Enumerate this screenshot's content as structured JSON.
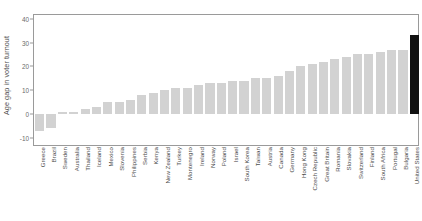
{
  "chart_data": {
    "type": "bar",
    "title": "",
    "xlabel": "",
    "ylabel": "Age gap in voter turnout",
    "ylim": [
      -13,
      42
    ],
    "yticks": [
      -10,
      0,
      10,
      20,
      30,
      40
    ],
    "ytick_labels": [
      "-10",
      "0",
      "10",
      "20",
      "30",
      "40"
    ],
    "grid": false,
    "legend": "none",
    "bar_color": "#d2d2d2",
    "highlight_color": "#111111",
    "highlight_category": "United States",
    "categories": [
      "Greece",
      "Brazil",
      "Sweden",
      "Australia",
      "Thailand",
      "Iceland",
      "Mexico",
      "Slovenia",
      "Philippines",
      "Serbia",
      "Kenya",
      "New Zealand",
      "Turkey",
      "Montenegro",
      "Ireland",
      "Norway",
      "Poland",
      "Israel",
      "South Korea",
      "Taiwan",
      "Austria",
      "Canada",
      "Germany",
      "Hong Kong",
      "Czech Republic",
      "Great Britain",
      "Romania",
      "Slovakia",
      "Switzerland",
      "Finland",
      "South Africa",
      "Portugal",
      "Bulgaria",
      "United States"
    ],
    "values": [
      -7,
      -6,
      1,
      1,
      2,
      3,
      5,
      5,
      6,
      8,
      9,
      10,
      11,
      11,
      12,
      13,
      13,
      14,
      14,
      15,
      15,
      16,
      18,
      20,
      21,
      22,
      23,
      24,
      25,
      25,
      26,
      27,
      27,
      33
    ]
  }
}
